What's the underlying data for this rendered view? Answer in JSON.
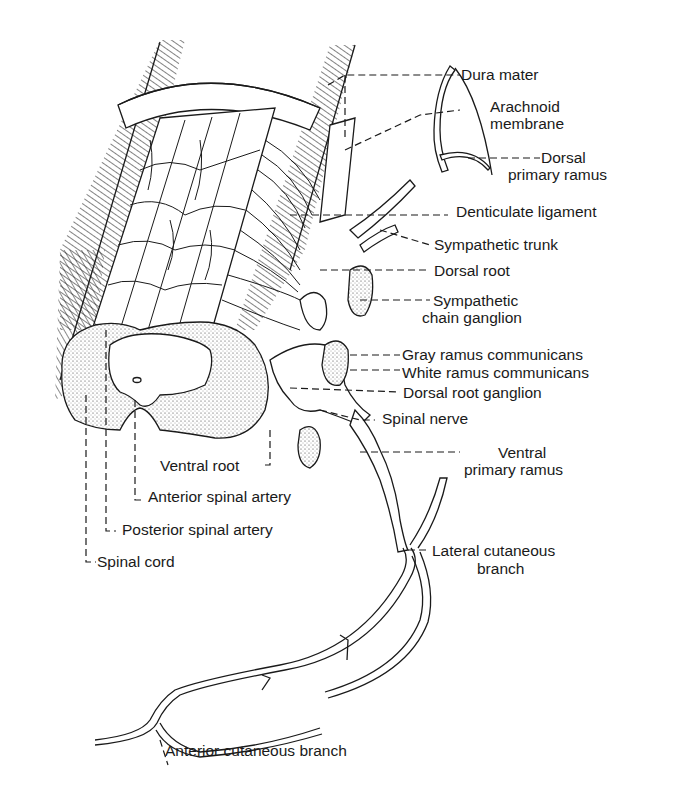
{
  "figure": {
    "colors": {
      "ink": "#1a1a1a",
      "background": "#ffffff"
    },
    "labels_right": [
      {
        "id": "dura-mater",
        "lines": [
          "Dura mater"
        ]
      },
      {
        "id": "arachnoid-membrane",
        "lines": [
          "Arachnoid",
          "membrane"
        ]
      },
      {
        "id": "dorsal-primary-ramus",
        "lines": [
          "Dorsal",
          "primary ramus"
        ]
      },
      {
        "id": "denticulate-ligament",
        "lines": [
          "Denticulate ligament"
        ]
      },
      {
        "id": "sympathetic-trunk",
        "lines": [
          "Sympathetic trunk"
        ]
      },
      {
        "id": "dorsal-root",
        "lines": [
          "Dorsal root"
        ]
      },
      {
        "id": "sympathetic-chain-ganglion",
        "lines": [
          "Sympathetic",
          "chain ganglion"
        ]
      },
      {
        "id": "gray-ramus-communicans",
        "lines": [
          "Gray ramus communicans"
        ]
      },
      {
        "id": "white-ramus-communicans",
        "lines": [
          "White ramus communicans"
        ]
      },
      {
        "id": "dorsal-root-ganglion",
        "lines": [
          "Dorsal root ganglion"
        ]
      },
      {
        "id": "spinal-nerve",
        "lines": [
          "Spinal nerve"
        ]
      },
      {
        "id": "ventral-primary-ramus",
        "lines": [
          "Ventral",
          "primary ramus"
        ]
      },
      {
        "id": "lateral-cutaneous-branch",
        "lines": [
          "Lateral cutaneous",
          "branch"
        ]
      }
    ],
    "labels_left": [
      {
        "id": "ventral-root",
        "lines": [
          "Ventral root"
        ]
      },
      {
        "id": "anterior-spinal-artery",
        "lines": [
          "Anterior spinal artery"
        ]
      },
      {
        "id": "posterior-spinal-artery",
        "lines": [
          "Posterior spinal artery"
        ]
      },
      {
        "id": "spinal-cord",
        "lines": [
          "Spinal cord"
        ]
      }
    ],
    "labels_bottom": [
      {
        "id": "anterior-cutaneous-branch",
        "lines": [
          "Anterior cutaneous branch"
        ]
      }
    ]
  }
}
